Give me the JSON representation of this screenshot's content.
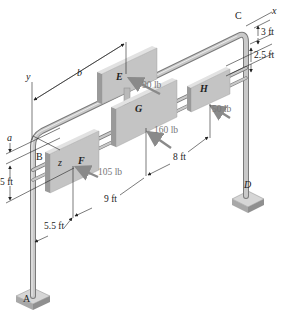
{
  "figure": {
    "axes": {
      "x": "x",
      "y": "y",
      "z": "z"
    },
    "points": {
      "A": "A",
      "B": "B",
      "C": "C",
      "D": "D",
      "E": "E",
      "F": "F",
      "G": "G",
      "H": "H"
    },
    "forces": {
      "E": "90 lb",
      "F": "105 lb",
      "G": "160 lb",
      "H": "50 lb"
    },
    "dimensions": {
      "a": "a",
      "b": "b",
      "d_3ft": "3 ft",
      "d_2_5ft": "2.5 ft",
      "d_5ft": "5 ft",
      "d_5_5ft": "5.5 ft",
      "d_9ft": "9 ft",
      "d_8ft": "8 ft"
    },
    "colors": {
      "pipe": "#b9b9b9",
      "pipe_edge": "#7a7a7a",
      "sign_front": "#c4c4c4",
      "sign_side": "#9a9a9a",
      "sign_top": "#e2e2e2",
      "base": "#bdbdbd",
      "line": "#222222",
      "force_arrow": "#8a8a8a"
    }
  }
}
